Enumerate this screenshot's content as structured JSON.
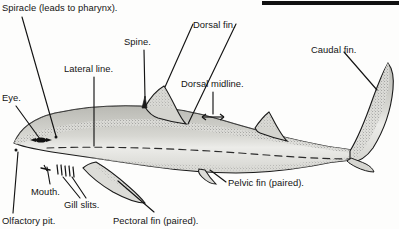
{
  "figure": {
    "style": "black-and-white stippled scientific illustration",
    "top_rule": {
      "name": "top-black-rule",
      "color": "#111111",
      "x": 262,
      "y": 1,
      "width": 137,
      "height": 4
    },
    "colors": {
      "ink": "#141414",
      "body_fill": "#d9d9d4",
      "fin_fill": "#d2d2cd",
      "outline": "#1a1a1a",
      "stipple": "#4a4a4a",
      "page": "#fdfdfc"
    }
  },
  "labels": [
    {
      "id": "spiracle",
      "text": "Spiracle (leads to pharynx).",
      "x": 2,
      "y": 3,
      "anchor_part": "spiracle"
    },
    {
      "id": "spine",
      "text": "Spine.",
      "x": 124,
      "y": 37,
      "anchor_part": "dorsal-fin-spine"
    },
    {
      "id": "dorsal-fin",
      "text": "Dorsal fin.",
      "x": 193,
      "y": 20,
      "anchor_part": "first-dorsal-fin"
    },
    {
      "id": "caudal-fin",
      "text": "Caudal fin.",
      "x": 311,
      "y": 45,
      "anchor_part": "caudal-fin"
    },
    {
      "id": "lateral-line",
      "text": "Lateral line.",
      "x": 64,
      "y": 64,
      "anchor_part": "lateral-line"
    },
    {
      "id": "dorsal-midline",
      "text": "Dorsal midline.",
      "x": 181,
      "y": 79,
      "anchor_part": "dorsal-midline"
    },
    {
      "id": "eye",
      "text": "Eye.",
      "x": 2,
      "y": 93,
      "anchor_part": "eye"
    },
    {
      "id": "mouth",
      "text": "Mouth.",
      "x": 31,
      "y": 187,
      "anchor_part": "mouth"
    },
    {
      "id": "gill-slits",
      "text": "Gill slits.",
      "x": 64,
      "y": 200,
      "anchor_part": "gill-slits"
    },
    {
      "id": "olfactory-pit",
      "text": "Olfactory pit.",
      "x": 2,
      "y": 216,
      "anchor_part": "olfactory-pit"
    },
    {
      "id": "pectoral-fin",
      "text": "Pectoral fin (paired).",
      "x": 113,
      "y": 216,
      "anchor_part": "pectoral-fin"
    },
    {
      "id": "pelvic-fin",
      "text": "Pelvic fin (paired).",
      "x": 228,
      "y": 178,
      "anchor_part": "pelvic-fin"
    }
  ]
}
